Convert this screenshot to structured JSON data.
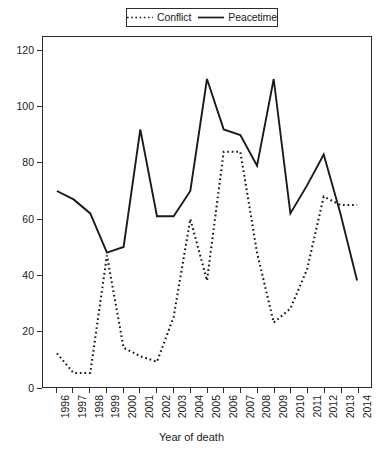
{
  "chart_data": {
    "type": "line",
    "title": "",
    "xlabel": "Year of death",
    "ylabel": "",
    "categories": [
      "1996",
      "1997",
      "1998",
      "1999",
      "2000",
      "2001",
      "2002",
      "2003",
      "2004",
      "2005",
      "2006",
      "2007",
      "2008",
      "2009",
      "2010",
      "2011",
      "2012",
      "2013",
      "2014"
    ],
    "x": [
      1996,
      1997,
      1998,
      1999,
      2000,
      2001,
      2002,
      2003,
      2004,
      2005,
      2006,
      2007,
      2008,
      2009,
      2010,
      2011,
      2012,
      2013,
      2014
    ],
    "series": [
      {
        "name": "Conflict",
        "style": "dotted",
        "color": "#1a1a1a",
        "values": [
          12,
          5,
          5,
          47,
          14,
          11,
          9,
          25,
          60,
          38,
          84,
          84,
          48,
          23,
          28,
          42,
          68,
          65,
          65
        ]
      },
      {
        "name": "Peacetime",
        "style": "solid",
        "color": "#1a1a1a",
        "values": [
          70,
          67,
          62,
          48,
          50,
          92,
          61,
          61,
          70,
          110,
          92,
          90,
          79,
          110,
          62,
          72,
          83,
          62,
          38
        ]
      }
    ],
    "ylim": [
      0,
      125
    ],
    "xlim": [
      1996,
      2014
    ],
    "yticks": [
      0,
      20,
      40,
      60,
      80,
      100,
      120
    ],
    "ytick_labels": [
      "0",
      "20",
      "40",
      "60",
      "80",
      "100",
      "120"
    ],
    "grid": false,
    "legend_position": "top-center",
    "legend_entries": [
      "Conflict",
      "Peacetime"
    ]
  },
  "legend": {
    "conflict_label": "Conflict",
    "peacetime_label": "Peacetime"
  },
  "axes": {
    "x_title": "Year of death"
  },
  "caption": ""
}
